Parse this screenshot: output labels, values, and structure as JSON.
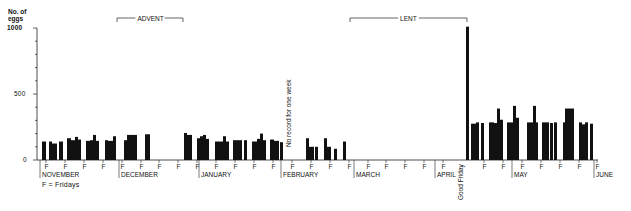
{
  "chart_data": {
    "type": "bar",
    "title": "",
    "ylabel": "No. of eggs",
    "xlabel": "",
    "ylim": [
      0,
      1000
    ],
    "yticks": [
      0,
      500,
      1000
    ],
    "grid": false,
    "legend_note": "F = Fridays",
    "months": [
      {
        "label": "NOVEMBER",
        "x": 42
      },
      {
        "label": "DECEMBER",
        "x": 121
      },
      {
        "label": "JANUARY",
        "x": 201
      },
      {
        "label": "FEBRUARY",
        "x": 283
      },
      {
        "label": "MARCH",
        "x": 356
      },
      {
        "label": "APRIL",
        "x": 437
      },
      {
        "label": "MAY",
        "x": 514
      },
      {
        "label": "JUNE",
        "x": 596
      }
    ],
    "periods": [
      {
        "label": "ADVENT",
        "x1": 117,
        "x2": 183
      },
      {
        "label": "LENT",
        "x1": 350,
        "x2": 467
      }
    ],
    "fridays_x": [
      46,
      65,
      84,
      103,
      122,
      141,
      159,
      178,
      197,
      216,
      235,
      254,
      273,
      292,
      311,
      330,
      349,
      368,
      386,
      405,
      424,
      443,
      484,
      503,
      522,
      541,
      560,
      579,
      597
    ],
    "annotations": [
      {
        "text": "No record for one week",
        "x": 291,
        "y": 147,
        "rotated": true
      },
      {
        "text": "Good Friday",
        "x": 463,
        "y": 200,
        "rotated": true
      }
    ],
    "bars": [
      {
        "x": 42,
        "w": 4,
        "v": 140
      },
      {
        "x": 49,
        "w": 3,
        "v": 140
      },
      {
        "x": 52,
        "w": 5,
        "v": 125
      },
      {
        "x": 59,
        "w": 4,
        "v": 140
      },
      {
        "x": 67,
        "w": 4,
        "v": 165
      },
      {
        "x": 71,
        "w": 4,
        "v": 150
      },
      {
        "x": 75,
        "w": 3,
        "v": 175
      },
      {
        "x": 78,
        "w": 3,
        "v": 155
      },
      {
        "x": 86,
        "w": 4,
        "v": 145
      },
      {
        "x": 90,
        "w": 3,
        "v": 150
      },
      {
        "x": 93,
        "w": 3,
        "v": 190
      },
      {
        "x": 96,
        "w": 3,
        "v": 145
      },
      {
        "x": 105,
        "w": 3,
        "v": 150
      },
      {
        "x": 108,
        "w": 5,
        "v": 145
      },
      {
        "x": 113,
        "w": 3,
        "v": 180
      },
      {
        "x": 124,
        "w": 3,
        "v": 150
      },
      {
        "x": 127,
        "w": 10,
        "v": 190
      },
      {
        "x": 145,
        "w": 5,
        "v": 195
      },
      {
        "x": 184,
        "w": 3,
        "v": 205
      },
      {
        "x": 187,
        "w": 5,
        "v": 190
      },
      {
        "x": 197,
        "w": 3,
        "v": 165
      },
      {
        "x": 200,
        "w": 3,
        "v": 180
      },
      {
        "x": 203,
        "w": 3,
        "v": 190
      },
      {
        "x": 206,
        "w": 3,
        "v": 160
      },
      {
        "x": 215,
        "w": 8,
        "v": 140
      },
      {
        "x": 223,
        "w": 3,
        "v": 180
      },
      {
        "x": 226,
        "w": 3,
        "v": 140
      },
      {
        "x": 233,
        "w": 9,
        "v": 150
      },
      {
        "x": 244,
        "w": 3,
        "v": 150
      },
      {
        "x": 252,
        "w": 5,
        "v": 140
      },
      {
        "x": 257,
        "w": 3,
        "v": 160
      },
      {
        "x": 260,
        "w": 3,
        "v": 200
      },
      {
        "x": 263,
        "w": 3,
        "v": 150
      },
      {
        "x": 270,
        "w": 4,
        "v": 155
      },
      {
        "x": 274,
        "w": 5,
        "v": 145
      },
      {
        "x": 280,
        "w": 3,
        "v": 135
      },
      {
        "x": 306,
        "w": 3,
        "v": 165
      },
      {
        "x": 309,
        "w": 5,
        "v": 100
      },
      {
        "x": 315,
        "w": 3,
        "v": 100
      },
      {
        "x": 324,
        "w": 3,
        "v": 165
      },
      {
        "x": 327,
        "w": 4,
        "v": 100
      },
      {
        "x": 334,
        "w": 3,
        "v": 85
      },
      {
        "x": 343,
        "w": 3,
        "v": 140
      },
      {
        "x": 466,
        "w": 3,
        "v": 1010
      },
      {
        "x": 471,
        "w": 5,
        "v": 275
      },
      {
        "x": 476,
        "w": 3,
        "v": 285
      },
      {
        "x": 481,
        "w": 3,
        "v": 280
      },
      {
        "x": 489,
        "w": 5,
        "v": 285
      },
      {
        "x": 494,
        "w": 3,
        "v": 280
      },
      {
        "x": 497,
        "w": 3,
        "v": 390
      },
      {
        "x": 500,
        "w": 3,
        "v": 305
      },
      {
        "x": 507,
        "w": 6,
        "v": 285
      },
      {
        "x": 513,
        "w": 3,
        "v": 410
      },
      {
        "x": 516,
        "w": 3,
        "v": 320
      },
      {
        "x": 527,
        "w": 7,
        "v": 285
      },
      {
        "x": 533,
        "w": 3,
        "v": 410
      },
      {
        "x": 536,
        "w": 2,
        "v": 285
      },
      {
        "x": 542,
        "w": 7,
        "v": 285
      },
      {
        "x": 550,
        "w": 3,
        "v": 280
      },
      {
        "x": 554,
        "w": 3,
        "v": 285
      },
      {
        "x": 563,
        "w": 2,
        "v": 285
      },
      {
        "x": 565,
        "w": 9,
        "v": 390
      },
      {
        "x": 579,
        "w": 3,
        "v": 285
      },
      {
        "x": 582,
        "w": 3,
        "v": 270
      },
      {
        "x": 585,
        "w": 3,
        "v": 285
      },
      {
        "x": 590,
        "w": 3,
        "v": 275
      }
    ]
  },
  "axis": {
    "ylabel_line1": "No. of",
    "ylabel_line2": "eggs",
    "ytick_1000": "1000",
    "ytick_500": "500",
    "ytick_0": "0",
    "friday_marker": "F"
  }
}
